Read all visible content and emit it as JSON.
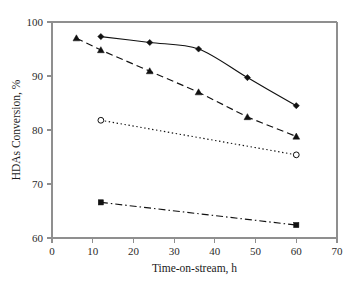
{
  "chart_data": {
    "type": "line",
    "title": "",
    "xlabel": "Time-on-stream, h",
    "ylabel": "HDAs Conversion, %",
    "xlim": [
      0,
      70
    ],
    "ylim": [
      60,
      100
    ],
    "xticks": [
      0,
      10,
      20,
      30,
      40,
      50,
      60,
      70
    ],
    "yticks": [
      60,
      70,
      80,
      90,
      100
    ],
    "grid": false,
    "legend": "none",
    "series": [
      {
        "name": "series-1",
        "marker": "filled-diamond",
        "linestyle": "solid",
        "color": "#111111",
        "x": [
          12,
          24,
          36,
          48,
          60
        ],
        "values": [
          97.3,
          96.2,
          95.0,
          89.7,
          84.5
        ]
      },
      {
        "name": "series-2",
        "marker": "filled-triangle",
        "linestyle": "dashed",
        "color": "#111111",
        "x": [
          6,
          12,
          24,
          36,
          48,
          60
        ],
        "values": [
          97.0,
          94.8,
          90.9,
          87.0,
          82.4,
          78.8
        ]
      },
      {
        "name": "series-3",
        "marker": "open-circle",
        "linestyle": "dotted",
        "color": "#111111",
        "x": [
          12,
          60
        ],
        "values": [
          81.8,
          75.4
        ]
      },
      {
        "name": "series-4",
        "marker": "filled-square",
        "linestyle": "dash-dot",
        "color": "#111111",
        "x": [
          12,
          60
        ],
        "values": [
          66.6,
          62.4
        ]
      }
    ]
  },
  "axes": {
    "x_title": "Time-on-stream, h",
    "y_title": "HDAs Conversion, %",
    "x_tick_labels": [
      "0",
      "10",
      "20",
      "30",
      "40",
      "50",
      "60",
      "70"
    ],
    "y_tick_labels": [
      "60",
      "70",
      "80",
      "90",
      "100"
    ]
  },
  "style": {
    "axis_color": "#8f8f8f",
    "ink_color": "#111111",
    "background": "#ffffff"
  }
}
